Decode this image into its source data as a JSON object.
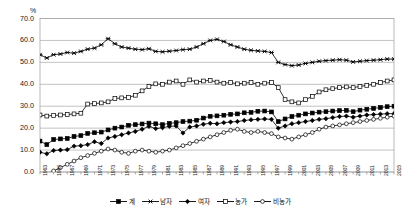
{
  "chart_data": {
    "type": "line",
    "title": "",
    "xlabel": "",
    "ylabel": "%",
    "ylim": [
      0,
      70
    ],
    "yticks": [
      0,
      10,
      20,
      30,
      40,
      50,
      60,
      70
    ],
    "ytick_labels": [
      "0.0",
      "10.0",
      "20.0",
      "30.0",
      "40.0",
      "50.0",
      "60.0",
      "70.0"
    ],
    "grid": true,
    "legend_position": "bottom",
    "x": [
      1963,
      1964,
      1965,
      1966,
      1967,
      1968,
      1969,
      1970,
      1971,
      1972,
      1973,
      1974,
      1975,
      1976,
      1977,
      1978,
      1979,
      1980,
      1981,
      1982,
      1983,
      1984,
      1985,
      1986,
      1987,
      1988,
      1989,
      1990,
      1991,
      1992,
      1993,
      1994,
      1995,
      1996,
      1997,
      1998,
      1999,
      2000,
      2001,
      2002,
      2003,
      2004,
      2005,
      2006,
      2007,
      2008,
      2009,
      2010,
      2011,
      2012,
      2013,
      2014,
      2015
    ],
    "xtick_labels": [
      "1963",
      "1965",
      "1967",
      "1969",
      "1971",
      "1973",
      "1975",
      "1977",
      "1979",
      "1981",
      "1983",
      "1985",
      "1987",
      "1989",
      "1991",
      "1993",
      "1995",
      "1997",
      "1999",
      "2001",
      "2003",
      "2005",
      "2007",
      "2009",
      "2011",
      "2013",
      "2015"
    ],
    "series": [
      {
        "name": "계",
        "marker": "filled-square",
        "color": "#000000",
        "fill": "#000000",
        "values": [
          14.1,
          12.5,
          14.8,
          15.1,
          15.3,
          16.2,
          16.6,
          17.6,
          17.9,
          18.2,
          19.2,
          20.0,
          20.5,
          21.3,
          21.6,
          21.9,
          22.3,
          22.0,
          21.6,
          22.2,
          22.5,
          23.0,
          23.2,
          23.6,
          24.6,
          25.4,
          25.6,
          25.9,
          26.3,
          26.5,
          27.0,
          27.2,
          27.7,
          27.8,
          27.4,
          23.0,
          24.2,
          25.3,
          25.9,
          26.5,
          26.9,
          27.3,
          27.5,
          27.8,
          28.0,
          28.1,
          27.5,
          28.2,
          28.6,
          29.0,
          29.4,
          29.8,
          30.0
        ]
      },
      {
        "name": "남자",
        "marker": "cross",
        "color": "#000000",
        "fill": "none",
        "values": [
          53.5,
          52.0,
          53.5,
          53.8,
          54.5,
          54.2,
          55.0,
          56.0,
          56.5,
          58.0,
          60.8,
          58.5,
          57.0,
          56.5,
          56.0,
          55.8,
          56.2,
          55.0,
          54.8,
          55.1,
          55.4,
          55.8,
          56.0,
          57.0,
          58.5,
          60.0,
          60.5,
          59.5,
          58.0,
          57.0,
          56.0,
          55.5,
          55.2,
          55.0,
          54.5,
          50.0,
          49.0,
          48.5,
          48.8,
          49.5,
          50.0,
          50.5,
          50.8,
          51.0,
          51.2,
          51.0,
          50.2,
          50.5,
          50.8,
          51.0,
          51.2,
          51.5,
          51.5
        ]
      },
      {
        "name": "여자",
        "marker": "filled-diamond",
        "color": "#000000",
        "fill": "#000000",
        "values": [
          9.0,
          8.3,
          9.8,
          10.0,
          10.2,
          11.8,
          12.0,
          12.5,
          13.8,
          13.0,
          15.5,
          16.2,
          17.0,
          17.8,
          18.5,
          19.5,
          20.8,
          19.8,
          20.2,
          20.8,
          21.0,
          17.8,
          20.5,
          21.0,
          21.8,
          22.2,
          22.0,
          22.5,
          22.8,
          23.0,
          23.5,
          23.8,
          24.0,
          24.2,
          24.0,
          20.0,
          21.0,
          22.0,
          22.5,
          23.0,
          23.5,
          24.0,
          24.3,
          24.8,
          25.3,
          25.5,
          25.0,
          25.5,
          26.0,
          26.2,
          26.4,
          26.6,
          26.6
        ]
      },
      {
        "name": "농가",
        "marker": "open-square",
        "color": "#000000",
        "fill": "#ffffff",
        "values": [
          26.0,
          25.5,
          25.8,
          26.0,
          26.2,
          26.5,
          26.8,
          31.0,
          31.2,
          31.5,
          32.0,
          33.5,
          33.8,
          34.0,
          35.0,
          37.0,
          39.0,
          40.2,
          40.0,
          41.0,
          41.5,
          40.0,
          42.0,
          41.0,
          41.5,
          41.8,
          41.0,
          40.5,
          40.8,
          40.2,
          40.5,
          40.8,
          40.0,
          40.5,
          40.8,
          38.5,
          33.0,
          32.0,
          31.5,
          33.0,
          34.5,
          36.5,
          37.5,
          38.0,
          38.5,
          38.8,
          38.5,
          39.0,
          39.5,
          40.0,
          40.8,
          41.5,
          42.0
        ]
      },
      {
        "name": "비농가",
        "marker": "open-circle",
        "color": "#000000",
        "fill": "#ffffff",
        "values": [
          -3.0,
          -1.0,
          0.5,
          2.0,
          3.5,
          5.0,
          6.5,
          7.5,
          8.5,
          9.5,
          10.5,
          10.0,
          9.0,
          8.5,
          9.5,
          10.0,
          9.5,
          9.0,
          9.5,
          10.0,
          11.0,
          12.0,
          13.0,
          14.0,
          15.0,
          16.0,
          17.0,
          18.0,
          19.0,
          19.5,
          18.5,
          18.0,
          18.5,
          18.0,
          17.5,
          16.0,
          15.5,
          15.0,
          16.0,
          17.0,
          18.0,
          19.5,
          20.5,
          21.0,
          21.5,
          22.0,
          22.5,
          23.0,
          23.5,
          24.0,
          24.5,
          25.0,
          25.5
        ]
      }
    ]
  }
}
